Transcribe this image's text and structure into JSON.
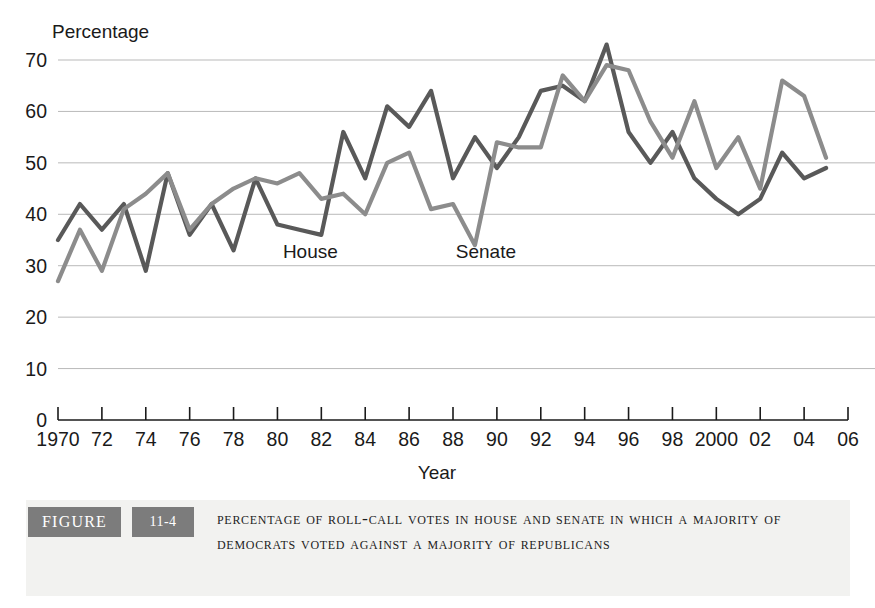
{
  "figure": {
    "tag_label": "FIGURE",
    "number_label": "11-4",
    "caption": "Percentage of Roll-Call Votes in House and Senate in Which a Majority of Democrats Voted Against a Majority of Republicans"
  },
  "chart_data": {
    "type": "line",
    "title": "",
    "ylabel": "Percentage",
    "xlabel": "Year",
    "ylim": [
      0,
      70
    ],
    "xlim": [
      1970,
      2006
    ],
    "yticks": [
      0,
      10,
      20,
      30,
      40,
      50,
      60,
      70
    ],
    "ytick_labels": [
      "0",
      "10",
      "20",
      "30",
      "40",
      "50",
      "60",
      "70"
    ],
    "xticks": [
      1970,
      1972,
      1974,
      1976,
      1978,
      1980,
      1982,
      1984,
      1986,
      1988,
      1990,
      1992,
      1994,
      1996,
      1998,
      2000,
      2002,
      2004,
      2006
    ],
    "xtick_labels": [
      "1970",
      "72",
      "74",
      "76",
      "78",
      "80",
      "82",
      "84",
      "86",
      "88",
      "90",
      "92",
      "94",
      "96",
      "98",
      "2000",
      "02",
      "04",
      "06"
    ],
    "grid": "horizontal",
    "legend_position": "inline-annotation",
    "x": [
      1970,
      1971,
      1972,
      1973,
      1974,
      1975,
      1976,
      1977,
      1978,
      1979,
      1980,
      1981,
      1982,
      1983,
      1984,
      1985,
      1986,
      1987,
      1988,
      1989,
      1990,
      1991,
      1992,
      1993,
      1994,
      1995,
      1996,
      1997,
      1998,
      1999,
      2000,
      2001,
      2002,
      2003,
      2004,
      2005
    ],
    "series": [
      {
        "name": "House",
        "color": "#595959",
        "label_x": 1981.5,
        "label_y": 31.5,
        "values": [
          35,
          42,
          37,
          42,
          29,
          48,
          36,
          42,
          33,
          47,
          38,
          37,
          36,
          56,
          47,
          61,
          57,
          64,
          47,
          55,
          49,
          55,
          64,
          65,
          62,
          73,
          56,
          50,
          56,
          47,
          43,
          40,
          43,
          52,
          47,
          49
        ]
      },
      {
        "name": "Senate",
        "color": "#8c8c8c",
        "label_x": 1989.5,
        "label_y": 31.5,
        "values": [
          27,
          37,
          29,
          41,
          44,
          48,
          37,
          42,
          45,
          47,
          46,
          48,
          43,
          44,
          40,
          50,
          52,
          41,
          42,
          34,
          54,
          53,
          53,
          67,
          62,
          69,
          68,
          58,
          51,
          62,
          49,
          55,
          45,
          66,
          63,
          51
        ]
      }
    ],
    "series_note": "House = darker gray line, Senate = lighter gray line"
  }
}
